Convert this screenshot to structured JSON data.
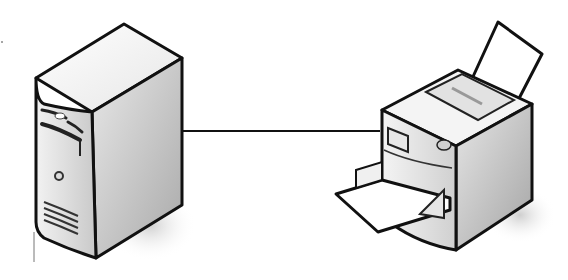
{
  "diagram": {
    "type": "network-connection",
    "nodes": [
      {
        "id": "server",
        "label": "",
        "icon": "server-tower-icon"
      },
      {
        "id": "printer",
        "label": "",
        "icon": "printer-icon"
      }
    ],
    "edges": [
      {
        "from": "server",
        "to": "printer",
        "style": "solid-line"
      }
    ],
    "colors": {
      "outline": "#111111",
      "body_light": "#f4f4f4",
      "body_mid": "#d6d6d6",
      "body_dark": "#a8a8a8",
      "shadow": "#dcdcdc",
      "paper": "#ffffff"
    }
  }
}
